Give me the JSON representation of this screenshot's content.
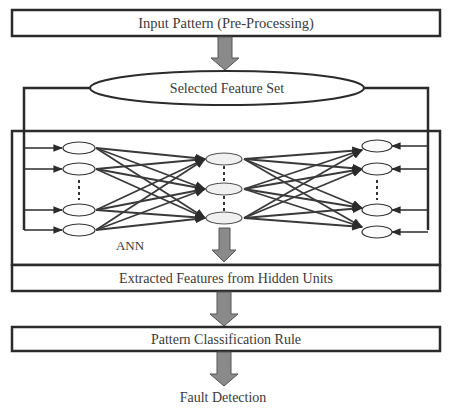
{
  "diagram": {
    "colors": {
      "line": "#2b2b2b",
      "arrow_fill": "#8a8a8a",
      "node_fill": "#f4f4f4",
      "background": "#ffffff"
    },
    "nodes": {
      "input_pattern": {
        "label": "Input Pattern (Pre-Processing)",
        "shape": "rectangle"
      },
      "selected_features": {
        "label": "Selected Feature Set",
        "shape": "ellipse"
      },
      "ann": {
        "label": "ANN",
        "shape": "rectangle-container"
      },
      "extracted_features": {
        "label": "Extracted Features from Hidden Units",
        "shape": "rectangle"
      },
      "classification_rule": {
        "label": "Pattern Classification Rule",
        "shape": "rectangle"
      },
      "fault_detection": {
        "label": "Fault Detection",
        "shape": "text"
      }
    },
    "network": {
      "input_neurons": 4,
      "hidden_neurons": 3,
      "output_neurons": 4,
      "ellipsis_marks": "⋮"
    },
    "edges": [
      {
        "from": "input_pattern",
        "to": "selected_features"
      },
      {
        "from": "selected_features",
        "to": "ann"
      },
      {
        "from": "ann",
        "to": "extracted_features"
      },
      {
        "from": "extracted_features",
        "to": "classification_rule"
      },
      {
        "from": "classification_rule",
        "to": "fault_detection"
      }
    ]
  }
}
